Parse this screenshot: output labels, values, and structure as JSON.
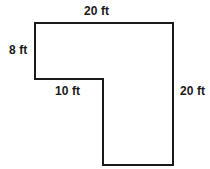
{
  "diagram": {
    "type": "geometry-dimension-diagram",
    "shape_name": "L-shape",
    "units": "ft",
    "canvas": {
      "width": 210,
      "height": 169
    },
    "style": {
      "background_color": "#ffffff",
      "stroke_color": "#1a1a1a",
      "stroke_width": 2,
      "fill_color": "none",
      "label_color": "#1a1a1a"
    },
    "vertices": [
      {
        "name": "top-left",
        "x": 35,
        "y": 23
      },
      {
        "name": "top-right",
        "x": 173,
        "y": 23
      },
      {
        "name": "bottom-right",
        "x": 173,
        "y": 165
      },
      {
        "name": "bottom-leg-left",
        "x": 103,
        "y": 165
      },
      {
        "name": "inner-corner",
        "x": 103,
        "y": 79
      },
      {
        "name": "arm-bottom-left",
        "x": 35,
        "y": 79
      }
    ],
    "path": "M 35 23 L 173 23 L 173 165 L 103 165 L 103 79 L 35 79 Z",
    "labels": [
      {
        "id": "label-top",
        "text": "20 ft",
        "edge": "top",
        "position": "above"
      },
      {
        "id": "label-left",
        "text": "8 ft",
        "edge": "left-short",
        "position": "outside-left"
      },
      {
        "id": "label-inner",
        "text": "10 ft",
        "edge": "notch-bottom",
        "position": "below"
      },
      {
        "id": "label-right",
        "text": "20 ft",
        "edge": "right-long",
        "position": "outside-right"
      }
    ],
    "edge_fragment": {
      "text": "ft",
      "note": "cropped glyph at left image border"
    }
  }
}
